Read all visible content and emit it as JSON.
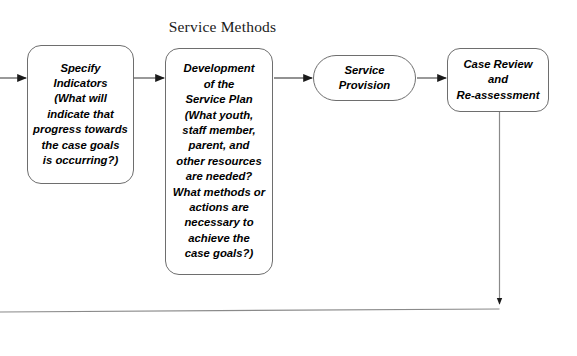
{
  "diagram": {
    "title": "Service Methods",
    "background_color": "#ffffff",
    "line_color": "#6e6e6e",
    "text_color": "#000000",
    "nodes": [
      {
        "id": "specify-indicators",
        "label": "Specify\nIndicators\n(What will\nindicate that\nprogress towards\nthe case goals\nis occurring?)",
        "shape": "rounded-rect"
      },
      {
        "id": "service-plan",
        "label": "Development\nof the\nService Plan\n(What youth,\nstaff member,\nparent, and\nother resources\nare needed?\nWhat methods or\nactions are\nnecessary to\nachieve the\ncase goals?)",
        "shape": "rounded-rect"
      },
      {
        "id": "service-provision",
        "label": "Service\nProvision",
        "shape": "pill"
      },
      {
        "id": "case-review",
        "label": "Case Review\nand\nRe-assessment",
        "shape": "rounded-rect"
      }
    ],
    "connectors": [
      {
        "id": "entry-arrow",
        "from": "left-edge",
        "to": "specify-indicators"
      },
      {
        "id": "indicators-to-plan",
        "from": "specify-indicators",
        "to": "service-plan"
      },
      {
        "id": "plan-to-provision",
        "from": "service-plan",
        "to": "service-provision"
      },
      {
        "id": "provision-to-review",
        "from": "service-provision",
        "to": "case-review"
      },
      {
        "id": "feedback-loop",
        "from": "case-review",
        "to": "left-edge"
      }
    ]
  }
}
